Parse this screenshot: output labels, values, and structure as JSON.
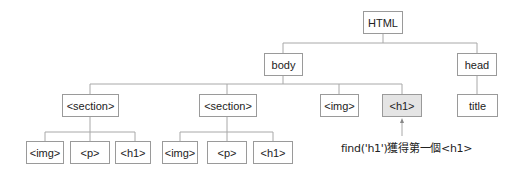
{
  "diagram": {
    "root": {
      "label": "HTML"
    },
    "level1": [
      {
        "label": "body"
      },
      {
        "label": "head"
      }
    ],
    "level2": [
      {
        "label": "<section>"
      },
      {
        "label": "<section>"
      },
      {
        "label": "<img>"
      },
      {
        "label": "<h1>",
        "highlighted": true
      },
      {
        "label": "title"
      }
    ],
    "level3": [
      {
        "label": "<img>"
      },
      {
        "label": "<p>"
      },
      {
        "label": "<h1>"
      },
      {
        "label": "<img>"
      },
      {
        "label": "<p>"
      },
      {
        "label": "<h1>"
      }
    ],
    "annotation": {
      "text": "find('h1')獲得第一個<h1>"
    },
    "colors": {
      "line": "#a8a8a8",
      "border": "#9a9a9a",
      "highlight_fill": "#e4e4e4"
    }
  }
}
